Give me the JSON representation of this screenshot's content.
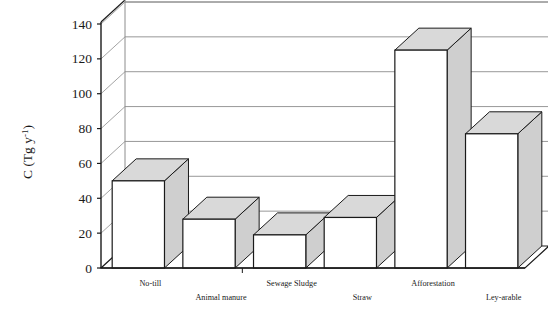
{
  "chart_data": {
    "type": "bar",
    "title": "",
    "subtitle": "",
    "xlabel": "",
    "ylabel": "C (Tg y-1)",
    "ylabel_parts": {
      "main": "C (Tg y",
      "sup": "-1",
      "tail": ")"
    },
    "categories": [
      "No-till",
      "Animal manure",
      "Sewage Sludge",
      "Straw",
      "Afforestation",
      "Ley-arable"
    ],
    "values": [
      50,
      28,
      19,
      29,
      125,
      77
    ],
    "ylim": [
      0,
      140
    ],
    "ytick_values": [
      0,
      20,
      40,
      60,
      80,
      100,
      120,
      140
    ],
    "ytick_labels": [
      "0",
      "20",
      "40",
      "60",
      "80",
      "100",
      "120",
      "140"
    ],
    "grid": true,
    "grid_axis": "y",
    "legend": false,
    "legend_position": "none",
    "style": "3d-column",
    "colors": {
      "bar_face": "#ffffff",
      "bar_top": "#d9d9d9",
      "bar_side": "#cfcfcf",
      "bar_outline": "#1a1a1a",
      "gridline": "#8c8c8c",
      "axis": "#1a1a1a",
      "floor": "#ffffff",
      "background": "#ffffff",
      "text": "#1a1a1a"
    }
  },
  "axis": {
    "y_title": "C (Tg y-1)",
    "tick_labels": [
      "140",
      "120",
      "100",
      "80",
      "60",
      "40",
      "20",
      "0"
    ]
  },
  "category_labels": {
    "row_top": [
      "No-till",
      "Sewage Sludge",
      "Afforestation"
    ],
    "row_bottom": [
      "Animal manure",
      "Straw",
      "Ley-arable"
    ]
  }
}
